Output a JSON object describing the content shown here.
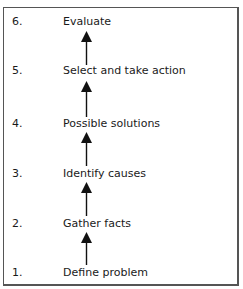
{
  "diagram": {
    "type": "vertical-flow",
    "direction": "bottom-to-top",
    "steps": [
      {
        "number": "6.",
        "label": "Evaluate"
      },
      {
        "number": "5.",
        "label": "Select and take action"
      },
      {
        "number": "4.",
        "label": "Possible solutions"
      },
      {
        "number": "3.",
        "label": "Identify causes"
      },
      {
        "number": "2.",
        "label": "Gather facts"
      },
      {
        "number": "1.",
        "label": "Define problem"
      }
    ],
    "arrows": [
      {
        "from": "1.",
        "to": "2."
      },
      {
        "from": "2.",
        "to": "3."
      },
      {
        "from": "3.",
        "to": "4."
      },
      {
        "from": "4.",
        "to": "5."
      },
      {
        "from": "5.",
        "to": "6."
      }
    ],
    "colors": {
      "text": "#1a1a1a",
      "arrow": "#111111",
      "border": "#555555",
      "background": "#ffffff"
    }
  }
}
